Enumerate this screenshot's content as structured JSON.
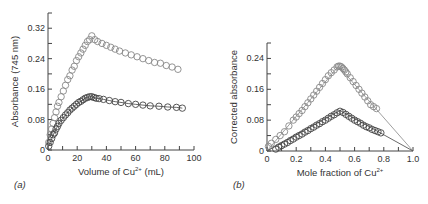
{
  "chart_data": [
    {
      "panel_label": "(a)",
      "type": "scatter",
      "title": "",
      "xlabel": "Volume of Cu2+ (mL)",
      "xlabel_parts": {
        "base": "Volume of Cu",
        "sup": "2+",
        "tail": " (mL)"
      },
      "ylabel": "Absorbance (745 nm)",
      "xlim": [
        0,
        100
      ],
      "ylim": [
        0,
        0.36
      ],
      "xticks": [
        0,
        20,
        40,
        60,
        80,
        100
      ],
      "xtick_labels": [
        "0",
        "20",
        "40",
        "60",
        "80",
        "100"
      ],
      "yticks": [
        0,
        0.08,
        0.16,
        0.24,
        0.32
      ],
      "ytick_labels": [
        "0",
        "0.08",
        "0.16",
        "0.24",
        "0.32"
      ],
      "grid": false,
      "legend": null,
      "series": [
        {
          "name": "upper",
          "color": "#888888",
          "line": false,
          "x": [
            0.5,
            1.5,
            2.5,
            3.5,
            4.5,
            5.5,
            6.5,
            7.5,
            9,
            10.5,
            12,
            13.5,
            15,
            16.5,
            18,
            19.5,
            21,
            22.5,
            24,
            25.5,
            27,
            28.5,
            30,
            32,
            34,
            37,
            40,
            43,
            46,
            49,
            53,
            57,
            61,
            65,
            69,
            73,
            77,
            81,
            85,
            89
          ],
          "y": [
            0.02,
            0.04,
            0.055,
            0.07,
            0.085,
            0.1,
            0.115,
            0.125,
            0.14,
            0.155,
            0.17,
            0.185,
            0.195,
            0.21,
            0.22,
            0.235,
            0.245,
            0.255,
            0.265,
            0.275,
            0.285,
            0.29,
            0.3,
            0.29,
            0.285,
            0.28,
            0.275,
            0.27,
            0.265,
            0.26,
            0.255,
            0.25,
            0.245,
            0.24,
            0.235,
            0.23,
            0.228,
            0.222,
            0.218,
            0.212
          ]
        },
        {
          "name": "lower",
          "color": "#444444",
          "line": true,
          "x": [
            0.5,
            1.5,
            2.5,
            3.5,
            4.5,
            5.5,
            6.5,
            7.5,
            9,
            10.5,
            12,
            13.5,
            15,
            16.5,
            18,
            19.5,
            21,
            22.5,
            24,
            25.5,
            27,
            28.5,
            30,
            31.5,
            33,
            35,
            38,
            42,
            46,
            50,
            55,
            60,
            65,
            70,
            76,
            82,
            88,
            92
          ],
          "y": [
            0.01,
            0.02,
            0.03,
            0.04,
            0.045,
            0.055,
            0.062,
            0.07,
            0.078,
            0.085,
            0.092,
            0.098,
            0.105,
            0.11,
            0.115,
            0.12,
            0.125,
            0.128,
            0.132,
            0.136,
            0.138,
            0.14,
            0.14,
            0.138,
            0.136,
            0.135,
            0.133,
            0.13,
            0.127,
            0.125,
            0.122,
            0.12,
            0.118,
            0.116,
            0.115,
            0.113,
            0.112,
            0.11
          ]
        }
      ]
    },
    {
      "panel_label": "(b)",
      "type": "scatter",
      "title": "",
      "xlabel": "Mole fraction of Cu2+",
      "xlabel_parts": {
        "base": "Mole fraction of Cu",
        "sup": "2+",
        "tail": ""
      },
      "ylabel": "Corrected absorbance",
      "xlim": [
        0,
        1.0
      ],
      "ylim": [
        0,
        0.28
      ],
      "xticks": [
        0,
        0.2,
        0.4,
        0.6,
        0.8,
        1.0
      ],
      "xtick_labels": [
        "0",
        "0.2",
        "0.4",
        "0.6",
        "0.8",
        "1.0"
      ],
      "yticks": [
        0,
        0.08,
        0.16,
        0.24
      ],
      "ytick_labels": [
        "0",
        "0.08",
        "0.16",
        "0.24"
      ],
      "grid": false,
      "legend": null,
      "series": [
        {
          "name": "upper",
          "color": "#888888",
          "x": [
            0.01,
            0.03,
            0.06,
            0.09,
            0.12,
            0.15,
            0.18,
            0.2,
            0.22,
            0.24,
            0.26,
            0.28,
            0.3,
            0.32,
            0.34,
            0.36,
            0.38,
            0.4,
            0.42,
            0.44,
            0.46,
            0.48,
            0.49,
            0.5,
            0.51,
            0.52,
            0.53,
            0.54,
            0.55,
            0.57,
            0.59,
            0.61,
            0.63,
            0.65,
            0.67,
            0.69,
            0.71,
            0.73,
            0.75
          ],
          "y": [
            0.012,
            0.02,
            0.03,
            0.04,
            0.05,
            0.065,
            0.08,
            0.088,
            0.097,
            0.105,
            0.115,
            0.125,
            0.135,
            0.145,
            0.155,
            0.165,
            0.175,
            0.185,
            0.195,
            0.203,
            0.21,
            0.218,
            0.22,
            0.22,
            0.218,
            0.214,
            0.21,
            0.205,
            0.2,
            0.19,
            0.18,
            0.17,
            0.16,
            0.15,
            0.14,
            0.13,
            0.12,
            0.115,
            0.11
          ],
          "fit_line": [
            [
              0,
              0
            ],
            [
              0.49,
              0.22
            ],
            [
              1.0,
              0
            ]
          ]
        },
        {
          "name": "lower",
          "color": "#444444",
          "x": [
            0.06,
            0.08,
            0.1,
            0.12,
            0.14,
            0.16,
            0.18,
            0.2,
            0.22,
            0.24,
            0.26,
            0.28,
            0.3,
            0.32,
            0.34,
            0.36,
            0.38,
            0.4,
            0.42,
            0.44,
            0.46,
            0.48,
            0.5,
            0.52,
            0.54,
            0.56,
            0.58,
            0.6,
            0.62,
            0.64,
            0.66,
            0.68,
            0.7,
            0.72,
            0.74,
            0.76,
            0.78
          ],
          "y": [
            0.005,
            0.01,
            0.014,
            0.018,
            0.022,
            0.027,
            0.031,
            0.036,
            0.04,
            0.044,
            0.049,
            0.053,
            0.058,
            0.062,
            0.067,
            0.071,
            0.076,
            0.08,
            0.085,
            0.09,
            0.094,
            0.099,
            0.103,
            0.1,
            0.095,
            0.09,
            0.085,
            0.08,
            0.076,
            0.072,
            0.067,
            0.063,
            0.06,
            0.056,
            0.053,
            0.05,
            0.047
          ],
          "fit_line": [
            [
              0,
              0
            ],
            [
              0.5,
              0.105
            ],
            [
              1.0,
              0
            ]
          ]
        }
      ]
    }
  ]
}
